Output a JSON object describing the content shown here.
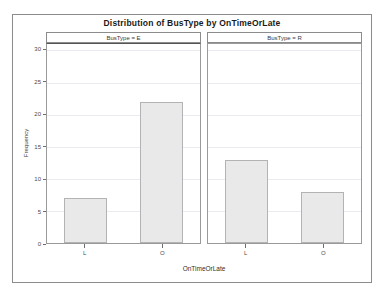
{
  "chart_data": {
    "type": "bar",
    "title": "Distribution of BusType by OnTimeOrLate",
    "xlabel": "OnTimeOrLate",
    "ylabel": "Frequency",
    "ylim": [
      0,
      31
    ],
    "yticks": [
      0,
      5,
      10,
      15,
      20,
      25,
      30
    ],
    "ytick_labels": [
      "0",
      "5",
      "10",
      "15",
      "20",
      "25",
      "30"
    ],
    "grid": true,
    "legend": "none",
    "categories": [
      "L",
      "O"
    ],
    "panel_variable": "BusType",
    "panels": [
      {
        "header": "BusType = E",
        "categories": [
          "L",
          "O"
        ],
        "values": [
          7,
          22
        ]
      },
      {
        "header": "BusType = R",
        "categories": [
          "L",
          "O"
        ],
        "values": [
          13,
          8
        ]
      }
    ],
    "colors": {
      "bar_fill": "#e9e9e9",
      "bar_border": "#b3b3b3",
      "frame": "#8c8c8c",
      "gridline": "#eceaf0",
      "text": "#3a3a3a"
    }
  }
}
